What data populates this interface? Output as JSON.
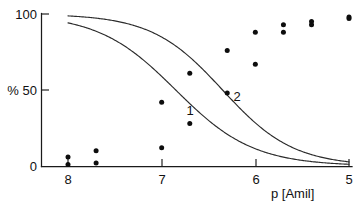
{
  "chart_data": {
    "type": "line",
    "title": "",
    "subtitle": "",
    "xlabel": "p [Amil]",
    "ylabel": "%",
    "ylabel_tick_prefix": "%",
    "x_ticks": [
      8,
      7,
      6,
      5
    ],
    "x_tick_labels": [
      "8",
      "7",
      "6",
      "5"
    ],
    "y_ticks": [
      0,
      50,
      100
    ],
    "y_tick_labels": [
      "0",
      "50",
      "100"
    ],
    "y_axis_label_at_50": "% 50",
    "xlim": [
      8,
      5
    ],
    "ylim": [
      0,
      100
    ],
    "x_axis_reversed": true,
    "grid": false,
    "legend_position": "inline-curve-labels",
    "series": [
      {
        "name": "1",
        "label": "1",
        "label_x": 6.82,
        "label_y": 41,
        "ec50": 6.85,
        "hill_slope": 1.05,
        "x": [
          8.0,
          7.7,
          7.0,
          6.7,
          6.3,
          6.0,
          5.7,
          5.4,
          5.0
        ],
        "y": [
          6,
          10,
          42,
          61,
          76,
          88,
          93,
          95,
          98
        ],
        "marker": "filled-circle",
        "curve_color": "#2b2b2b"
      },
      {
        "name": "2",
        "label": "2",
        "label_x": 6.32,
        "label_y": 50,
        "ec50": 6.35,
        "hill_slope": 1.15,
        "x": [
          8.0,
          7.7,
          7.0,
          6.7,
          6.3,
          6.0,
          5.7,
          5.4,
          5.0
        ],
        "y": [
          1,
          2,
          12,
          28,
          48,
          67,
          88,
          93,
          97
        ],
        "marker": "filled-circle",
        "curve_color": "#2b2b2b"
      }
    ],
    "annotations": [
      {
        "text": "1",
        "series": "1"
      },
      {
        "text": "2",
        "series": "2"
      }
    ]
  },
  "figure": {
    "x_axis_title": "p [Amil]",
    "y_axis_tick_top": "100",
    "y_axis_tick_mid": "% 50",
    "y_axis_tick_bottom": "0",
    "x_tick_1": "8",
    "x_tick_2": "7",
    "x_tick_3": "6",
    "x_tick_4": "5",
    "curve_label_1": "1",
    "curve_label_2": "2"
  }
}
